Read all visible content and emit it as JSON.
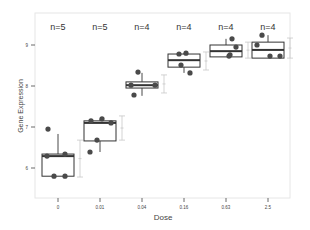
{
  "chart_data": {
    "type": "box",
    "title": "",
    "xlabel": "Dose",
    "ylabel": "Gene Expression",
    "ylim": [
      5.3,
      9.8
    ],
    "yticks": [
      6,
      7,
      8,
      9
    ],
    "grid": false,
    "categories": [
      "0",
      "0.01",
      "0.04",
      "0.16",
      "0.63",
      "2.5"
    ],
    "annotations": [
      "n=5",
      "n=5",
      "n=4",
      "n=4",
      "n=4",
      "n=4"
    ],
    "series": [
      {
        "dose": "0",
        "n": 5,
        "q1": 5.8,
        "median": 6.29,
        "q3": 6.34,
        "whisker_low": 5.8,
        "whisker_high": 6.83,
        "points": [
          6.95,
          6.29,
          6.34,
          5.8,
          5.8
        ],
        "errorbar": [
          5.78,
          6.68
        ]
      },
      {
        "dose": "0.01",
        "n": 5,
        "q1": 6.66,
        "median": 7.1,
        "q3": 7.15,
        "whisker_low": 6.39,
        "whisker_high": 7.2,
        "points": [
          7.15,
          7.2,
          7.1,
          6.68,
          6.39
        ],
        "errorbar": [
          6.68,
          7.27
        ]
      },
      {
        "dose": "0.04",
        "n": 4,
        "q1": 7.95,
        "median": 8.02,
        "q3": 8.1,
        "whisker_low": 7.76,
        "whisker_high": 8.32,
        "points": [
          8.34,
          8.02,
          8.02,
          7.78
        ],
        "errorbar": [
          7.83,
          8.27
        ]
      },
      {
        "dose": "0.16",
        "n": 4,
        "q1": 8.46,
        "median": 8.63,
        "q3": 8.78,
        "whisker_low": 8.32,
        "whisker_high": 8.8,
        "points": [
          8.78,
          8.8,
          8.51,
          8.32
        ],
        "errorbar": [
          8.39,
          8.83
        ]
      },
      {
        "dose": "0.63",
        "n": 4,
        "q1": 8.71,
        "median": 8.85,
        "q3": 9.0,
        "whisker_low": 8.73,
        "whisker_high": 9.15,
        "points": [
          9.15,
          8.95,
          8.76,
          8.73
        ],
        "errorbar": [
          8.68,
          9.07
        ]
      },
      {
        "dose": "2.5",
        "n": 4,
        "q1": 8.68,
        "median": 8.88,
        "q3": 9.07,
        "whisker_low": 8.73,
        "whisker_high": 9.24,
        "points": [
          9.24,
          9.0,
          8.73,
          8.73
        ],
        "errorbar": [
          8.68,
          9.17
        ]
      }
    ],
    "colors": {
      "box": "#333333",
      "point": "#4a4a4a",
      "errorbar": "#c8c8c8",
      "panel_border": "#e6e6e6",
      "axis_text": "#444444",
      "annotation_text": "#333333"
    }
  }
}
